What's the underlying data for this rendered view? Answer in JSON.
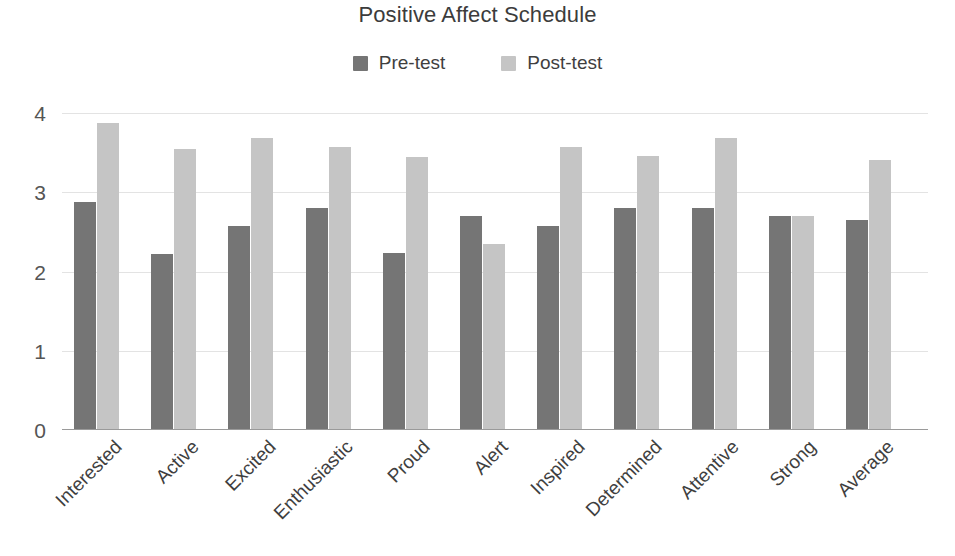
{
  "chart_data": {
    "type": "bar",
    "title": "Positive Affect Schedule",
    "xlabel": "",
    "ylabel": "",
    "ylim": [
      0,
      4
    ],
    "yticks": [
      0,
      1,
      2,
      3,
      4
    ],
    "grid": true,
    "legend_position": "top-center",
    "categories": [
      "Interested",
      "Active",
      "Excited",
      "Enthusiastic",
      "Proud",
      "Alert",
      "Inspired",
      "Determined",
      "Attentive",
      "Strong",
      "Average"
    ],
    "series": [
      {
        "name": "Pre-test",
        "color": "#757575",
        "values": [
          2.88,
          2.22,
          2.57,
          2.8,
          2.23,
          2.7,
          2.57,
          2.8,
          2.8,
          2.7,
          2.65
        ]
      },
      {
        "name": "Post-test",
        "color": "#c5c5c5",
        "values": [
          3.88,
          3.55,
          3.68,
          3.57,
          3.45,
          2.35,
          3.57,
          3.46,
          3.68,
          2.7,
          3.41
        ]
      }
    ]
  },
  "colors": {
    "pre_test": "#757575",
    "post_test": "#c5c5c5",
    "gridline": "#e3e3e3",
    "axis": "#9a9a9a",
    "text": "#3f3f3f",
    "background": "#ffffff"
  }
}
